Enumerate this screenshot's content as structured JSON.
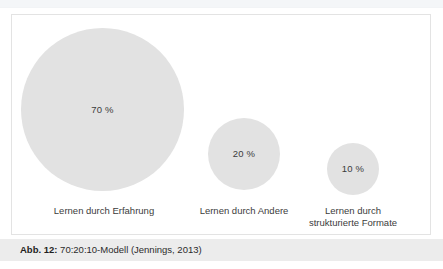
{
  "figure": {
    "caption_prefix": "Abb. 12:",
    "caption_text": " 70:20:10-Modell (Jennings, 2013)",
    "frame_border_color": "#e3e3e3",
    "caption_bar_color": "#ececec",
    "background_color": "#ffffff"
  },
  "chart_data": {
    "type": "scatter",
    "title": "70:20:10-Modell (Jennings, 2013)",
    "xlabel": "",
    "ylabel": "",
    "grid": false,
    "legend": "none",
    "note": "Proportional-area bubble diagram; bubble area encodes the percentage share of each learning mode.",
    "categories": [
      "Lernen durch Erfahrung",
      "Lernen durch Andere",
      "Lernen durch strukturierte Formate"
    ],
    "values": [
      70,
      20,
      10
    ],
    "value_labels": [
      "70 %",
      "20 %",
      "10 %"
    ],
    "bubbles": [
      {
        "label_line1": "Lernen durch Erfahrung",
        "label_line2": "",
        "value": 70,
        "value_label": "70 %",
        "color": "#e2e2e2",
        "diameter_px": 163
      },
      {
        "label_line1": "Lernen durch Andere",
        "label_line2": "",
        "value": 20,
        "value_label": "20 %",
        "color": "#e2e2e2",
        "diameter_px": 72
      },
      {
        "label_line1": "Lernen durch",
        "label_line2": "strukturierte Formate",
        "value": 10,
        "value_label": "10 %",
        "color": "#e2e2e2",
        "diameter_px": 52
      }
    ],
    "labels_multiline": [
      "Lernen durch Erfahrung",
      "Lernen durch Andere",
      "Lernen durch\nstrukturierte Formate"
    ]
  }
}
